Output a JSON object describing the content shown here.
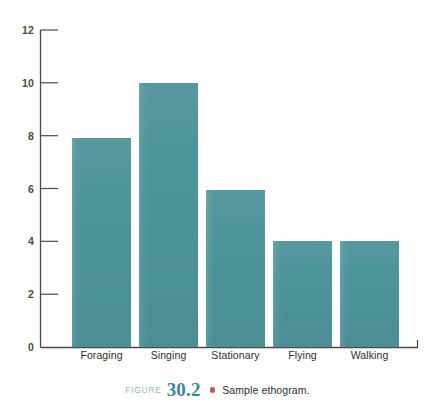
{
  "chart_data": {
    "type": "bar",
    "title": "",
    "subtitle": "",
    "xlabel": "",
    "ylabel": "",
    "categories": [
      "Foraging",
      "Singing",
      "Stationary",
      "Flying",
      "Walking"
    ],
    "values": [
      7.9,
      10,
      5.95,
      4,
      4
    ],
    "ylim": [
      0,
      12
    ],
    "yticks": [
      0,
      2,
      4,
      6,
      8,
      10,
      12
    ],
    "ytick_labels": [
      "0",
      "2",
      "4",
      "6",
      "8",
      "10",
      "12"
    ],
    "grid": false,
    "legend": false,
    "legend_position": "none",
    "bar_color": "#4e939a",
    "axis_color": "#4a4a4a",
    "annotations": []
  },
  "caption": {
    "figure_word": "FIGURE",
    "number": "30.2",
    "bullet": "bullet-dot",
    "text": "Sample ethogram.",
    "figure_word_color": "#93b9bd",
    "number_color": "#3b8a93",
    "bullet_color": "#a8605c"
  },
  "colors": {
    "bar": "#4e939a",
    "axis": "#4a4a4a",
    "tick_label": "#4a4a4a",
    "category_label": "#2f2f2f",
    "background": "#fefefe"
  }
}
